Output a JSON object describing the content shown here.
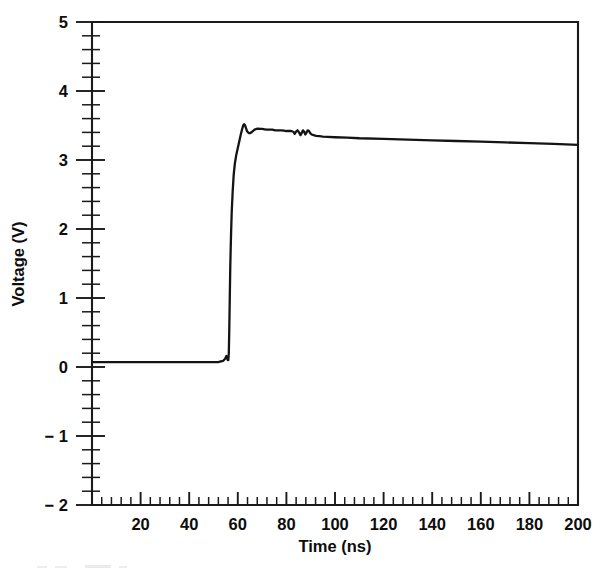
{
  "figure": {
    "background_color": "#ffffff",
    "line_color": "#141414",
    "axis_color": "#1a1a1a",
    "text_color": "#0d0d0d"
  },
  "chart_data": {
    "type": "line",
    "title": "",
    "xlabel": "Time (ns)",
    "ylabel": "Voltage (V)",
    "xlim": [
      0,
      200
    ],
    "ylim": [
      -2,
      5
    ],
    "grid": false,
    "legend": null,
    "x_ticks": [
      0,
      20,
      40,
      60,
      80,
      100,
      120,
      140,
      160,
      180,
      200
    ],
    "x_tick_labels": [
      "",
      "20",
      "40",
      "60",
      "80",
      "100",
      "120",
      "140",
      "160",
      "180",
      "200"
    ],
    "x_minor_tick_interval": 4,
    "y_ticks": [
      -2,
      -1,
      0,
      1,
      2,
      3,
      4,
      5
    ],
    "y_tick_labels": [
      "− 2",
      "− 1",
      "0",
      "1",
      "2",
      "3",
      "4",
      "5"
    ],
    "y_minor_tick_interval": 0.2,
    "series": [
      {
        "name": "output voltage",
        "x": [
          0.5,
          4,
          8,
          12,
          16,
          20,
          24,
          28,
          32,
          36,
          40,
          44,
          48,
          50,
          52,
          53,
          54,
          54.8,
          55.3,
          55.6,
          55.9,
          56.1,
          56.3,
          56.5,
          56.7,
          56.9,
          57.2,
          57.5,
          57.9,
          58.3,
          58.8,
          59.3,
          59.8,
          60.3,
          60.8,
          61.3,
          61.8,
          62.2,
          62.6,
          63.0,
          63.4,
          63.8,
          64.2,
          64.6,
          65.0,
          65.6,
          66.2,
          66.9,
          67.6,
          68.4,
          69.2,
          70.1,
          71.0,
          72.0,
          73.0,
          74.2,
          75.4,
          76.6,
          77.8,
          79.0,
          80.0,
          81.0,
          82.0,
          82.8,
          83.4,
          84.0,
          84.6,
          85.2,
          85.8,
          86.3,
          86.8,
          87.3,
          87.8,
          88.3,
          88.8,
          89.3,
          89.8,
          90.4,
          91.2,
          92.2,
          93.5,
          95.0,
          97.0,
          100.0,
          105.0,
          110.0,
          120.0,
          130.0,
          140.0,
          150.0,
          160.0,
          170.0,
          180.0,
          190.0,
          200.0
        ],
        "y": [
          0.07,
          0.07,
          0.07,
          0.07,
          0.07,
          0.07,
          0.07,
          0.07,
          0.07,
          0.07,
          0.07,
          0.07,
          0.07,
          0.07,
          0.07,
          0.08,
          0.09,
          0.12,
          0.16,
          0.13,
          0.1,
          0.1,
          0.2,
          0.55,
          1.0,
          1.45,
          1.9,
          2.25,
          2.55,
          2.78,
          2.95,
          3.06,
          3.14,
          3.22,
          3.3,
          3.38,
          3.45,
          3.5,
          3.52,
          3.5,
          3.46,
          3.42,
          3.4,
          3.39,
          3.39,
          3.4,
          3.42,
          3.44,
          3.45,
          3.455,
          3.45,
          3.45,
          3.445,
          3.44,
          3.44,
          3.44,
          3.43,
          3.43,
          3.43,
          3.425,
          3.42,
          3.42,
          3.42,
          3.41,
          3.38,
          3.41,
          3.43,
          3.4,
          3.36,
          3.39,
          3.43,
          3.41,
          3.37,
          3.4,
          3.43,
          3.42,
          3.39,
          3.37,
          3.36,
          3.35,
          3.345,
          3.34,
          3.335,
          3.33,
          3.325,
          3.315,
          3.305,
          3.295,
          3.285,
          3.275,
          3.265,
          3.255,
          3.245,
          3.235,
          3.22
        ]
      }
    ],
    "annotations": {
      "baseline_voltage": 0.07,
      "rise_start_ns": 56,
      "overshoot_peak_v": 3.52,
      "settle_v": 3.43,
      "final_v": 3.22
    }
  }
}
